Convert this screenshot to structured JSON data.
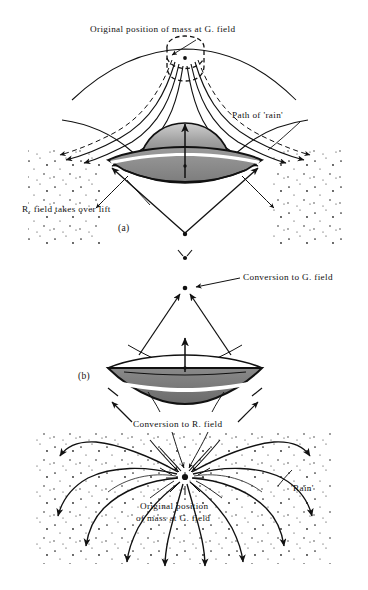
{
  "figure": {
    "background": "#ffffff",
    "ink": "#111111",
    "shade_light": "#b9b9b9",
    "shade_mid": "#8f8f8f",
    "shade_dark": "#6e6e6e"
  },
  "labels": {
    "top_original_position": "Original position of mass at G. field",
    "path_of_rain": "Path of 'rain'",
    "r_field_takes_over_lift": "R. field takes over lift",
    "conversion_to_g_field": "Conversion to G. field",
    "conversion_to_r_field": "Conversion to R. field",
    "bottom_original_line1": "Original position",
    "bottom_original_line2": "of mass at G. field",
    "rain": "'Rain'"
  },
  "panels": [
    {
      "id": "a",
      "label": "(a)",
      "x": 118,
      "y": 223
    },
    {
      "id": "b",
      "label": "(b)",
      "x": 78,
      "y": 371
    }
  ],
  "diagram_data": {
    "type": "schematic",
    "panel_a": {
      "craft": "saucer with dome on top, shaded lens body",
      "craft_center": [
        185,
        160
      ],
      "craft_width": 122,
      "original_mass_marker": [
        185,
        60
      ],
      "convergence_point": [
        185,
        235
      ],
      "field_direction": "rain converges inward and upward toward craft",
      "annotations": [
        "Original position of mass at G. field",
        "Path of 'rain'",
        "R. field takes over lift"
      ]
    },
    "panel_b": {
      "craft": "inverted saucer, flat top with dark shaded bowl beneath",
      "craft_center": [
        185,
        375
      ],
      "craft_width": 122,
      "conversion_point_upper": [
        185,
        288
      ],
      "upper_dot": [
        185,
        258
      ],
      "burst_point": [
        185,
        477
      ],
      "field_direction": "rain radiates outward and downward from burst point",
      "annotations": [
        "Conversion to G. field",
        "Conversion to R. field",
        "Original position of mass at G. field",
        "'Rain'"
      ]
    }
  }
}
